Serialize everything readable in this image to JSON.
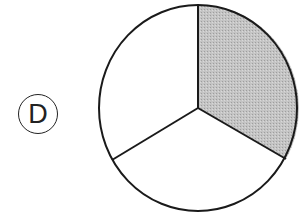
{
  "option_label": "D",
  "figure": {
    "type": "circle-divided",
    "total_parts": 3,
    "shaded_parts": 1,
    "shaded_fraction": "1/3",
    "shaded_color": "#bdbdbd",
    "unshaded_color": "#ffffff",
    "stroke_color": "#1a1a1a"
  }
}
